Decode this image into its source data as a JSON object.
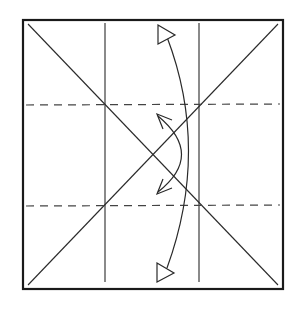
{
  "diagram": {
    "type": "origami-fold-diagram",
    "colors": {
      "background": "#ffffff",
      "line": "#2a2a2a",
      "border": "#1a1a1a",
      "dash": "#444444"
    },
    "paper": {
      "x": 23,
      "y": 20,
      "width": 260,
      "height": 269
    },
    "creases": {
      "diagonals": [
        {
          "x1": 28,
          "y1": 24,
          "x2": 278,
          "y2": 285
        },
        {
          "x1": 278,
          "y1": 24,
          "x2": 28,
          "y2": 285
        }
      ],
      "verticals": [
        {
          "x": 105,
          "y1": 23,
          "y2": 282
        },
        {
          "x": 199,
          "y1": 23,
          "y2": 282
        }
      ]
    },
    "valley_folds": [
      {
        "y": 105,
        "x1": 26,
        "x2": 280
      },
      {
        "y": 206,
        "x1": 26,
        "x2": 280
      }
    ],
    "arrows": [
      {
        "name": "outer-fold-arrow",
        "path": "M 167 37 Q 210 150 167 268",
        "heads": "hollow-triangle"
      },
      {
        "name": "inner-fold-arrow",
        "path": "M 158 116 Q 205 155 158 192",
        "heads": "open"
      }
    ]
  }
}
